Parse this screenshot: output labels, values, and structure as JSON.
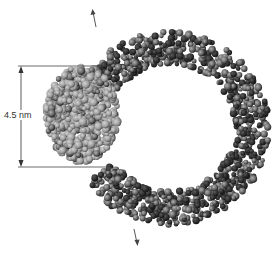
{
  "figure": {
    "scale_label": "4.5 nm",
    "colors": {
      "dna_light": "#8a8a8a",
      "dna_dark": "#2e2e2e",
      "protein_light": "#a8a8a8",
      "protein_dark": "#555555",
      "lines": "#444444"
    }
  }
}
